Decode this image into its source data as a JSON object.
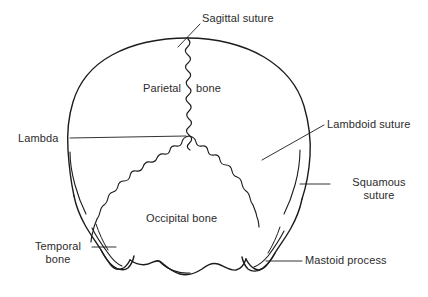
{
  "figure": {
    "view": "occipital (rear) view",
    "line_color": "#1c1c1c",
    "text_color": "#2b2b2b",
    "background_color": "#ffffff",
    "width": 428,
    "height": 297
  },
  "labels": {
    "sagittal_suture": "Sagittal suture",
    "parietal_bone_word1": "Parietal",
    "parietal_bone_word2": "bone",
    "lambda": "Lambda",
    "lambdoid_suture": "Lambdoid suture",
    "squamous_suture_line1": "Squamous",
    "squamous_suture_line2": "suture",
    "occipital_bone": "Occipital bone",
    "temporal_bone_line1": "Temporal",
    "temporal_bone_line2": "bone",
    "mastoid_process": "Mastoid process"
  },
  "structures": [
    {
      "name": "Sagittal suture",
      "type": "suture",
      "position": "superior midline"
    },
    {
      "name": "Parietal bone",
      "type": "bone",
      "position": "upper left and right"
    },
    {
      "name": "Lambda",
      "type": "landmark",
      "position": "junction of sagittal and lambdoid sutures"
    },
    {
      "name": "Lambdoid suture",
      "type": "suture",
      "position": "inverted V, left and right"
    },
    {
      "name": "Squamous suture",
      "type": "suture",
      "position": "lateral right"
    },
    {
      "name": "Occipital bone",
      "type": "bone",
      "position": "inferior centre"
    },
    {
      "name": "Temporal bone",
      "type": "bone",
      "position": "inferior left"
    },
    {
      "name": "Mastoid process",
      "type": "process",
      "position": "inferior right"
    }
  ]
}
